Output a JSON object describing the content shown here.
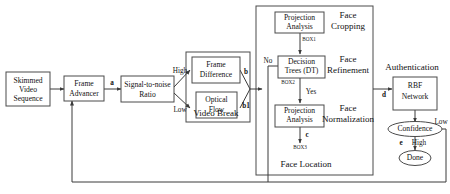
{
  "diagram": {
    "nodes": {
      "skimmed_video": "Skimmed\nVideo\nSequence",
      "skimmed_video_l1": "Skimmed",
      "skimmed_video_l2": "Video",
      "skimmed_video_l3": "Sequence",
      "frame_advancer_l1": "Frame",
      "frame_advancer_l2": "Advancer",
      "snr_l1": "Signal-to-noise",
      "snr_l2": "Ratio",
      "frame_difference_l1": "Frame",
      "frame_difference_l2": "Difference",
      "optical_flow_l1": "Optical",
      "optical_flow_l2": "Flow",
      "projection_analysis_1_l1": "Projection",
      "projection_analysis_1_l2": "Analysis",
      "decision_trees_l1": "Decision",
      "decision_trees_l2": "Trees (DT)",
      "projection_analysis_2_l1": "Projection",
      "projection_analysis_2_l2": "Analysis",
      "rbf_network_l1": "RBF",
      "rbf_network_l2": "Network",
      "confidence": "Confidence",
      "done": "Done"
    },
    "groups": {
      "video_break": "Video Break",
      "face_location": "Face Location"
    },
    "sections": {
      "face_cropping_l1": "Face",
      "face_cropping_l2": "Cropping",
      "face_refinement_l1": "Face",
      "face_refinement_l2": "Refinement",
      "face_normalization_l1": "Face",
      "face_normalization_l2": "Normalization",
      "authentication": "Authentication"
    },
    "box_tags": {
      "box1": "BOX1",
      "box2": "BOX2",
      "box3": "BOX3"
    },
    "edge_labels": {
      "a": "a",
      "b": "b",
      "b1": "b1",
      "c": "c",
      "d": "d",
      "e": "e",
      "high_snr": "High",
      "low_snr": "Low",
      "no": "No",
      "yes": "Yes",
      "high_conf": "High",
      "low_conf": "Low"
    },
    "colors": {
      "stroke": "#4a4a4a",
      "edge": "#3a3a3a",
      "fill": "#ffffff",
      "text": "#111111"
    }
  }
}
